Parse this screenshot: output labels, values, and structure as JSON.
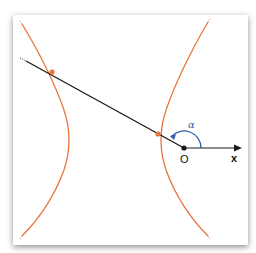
{
  "diagram": {
    "type": "hyperbola with ray through focus",
    "colors": {
      "curve": "#e8743a",
      "line": "#1a1a1a",
      "angle": "#2e5fa8",
      "point": "#e8743a"
    },
    "labels": {
      "origin": "O",
      "x_axis": "x",
      "angle": "α"
    }
  }
}
